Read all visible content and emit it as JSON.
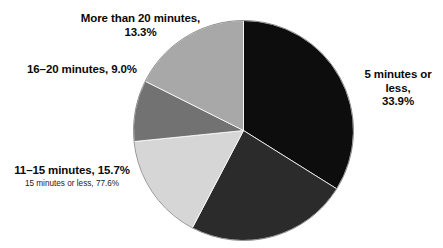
{
  "chart_data": {
    "type": "pie",
    "title": "",
    "subtitle": "",
    "xlabel": "",
    "ylabel": "",
    "legend_position": "none",
    "grid": false,
    "start_angle_deg": 0,
    "direction": "clockwise",
    "categories": [
      "5 minutes or less",
      "6–10 minutes",
      "11–15 minutes",
      "16–20 minutes",
      "More than 20 minutes"
    ],
    "values": [
      33.9,
      23.8,
      15.7,
      9.0,
      13.3
    ],
    "units": "%",
    "colors": [
      "#0d0d0d",
      "#2b2b2b",
      "#d6d6d6",
      "#727272",
      "#a8a8a8"
    ],
    "slices": [
      {
        "name": "5 minutes or less",
        "value": 33.9,
        "value_text": "33.9%",
        "color": "#0d0d0d",
        "start_deg": 0,
        "end_deg": 122.04,
        "labeled": true
      },
      {
        "name": "6–10 minutes",
        "value": 23.8,
        "value_text": "23.8%",
        "color": "#2b2b2b",
        "start_deg": 122.04,
        "end_deg": 207.72,
        "labeled": false
      },
      {
        "name": "11–15 minutes",
        "value": 15.7,
        "value_text": "15.7%",
        "color": "#d6d6d6",
        "start_deg": 207.72,
        "end_deg": 264.24,
        "labeled": true
      },
      {
        "name": "16–20 minutes",
        "value": 9.0,
        "value_text": "9.0%",
        "color": "#727272",
        "start_deg": 264.24,
        "end_deg": 296.64,
        "labeled": true
      },
      {
        "name": "More than 20 minutes",
        "value": 13.3,
        "value_text": "13.3%",
        "color": "#a8a8a8",
        "start_deg": 296.64,
        "end_deg": 360,
        "labeled": true
      }
    ],
    "annotations": [
      {
        "name": "cumulative-15-minutes-or-less",
        "text": "15 minutes or less, 77.6%",
        "value": 77.6
      }
    ]
  },
  "labels": {
    "more_than_20": "More than 20 minutes,\n13.3%",
    "sixteen_to_twenty": "16–20 minutes, 9.0%",
    "eleven_to_fifteen": "11–15 minutes, 15.7%",
    "fifteen_or_less_note": "15 minutes or less, 77.6%",
    "five_or_less": "5 minutes or less,\n33.9%"
  }
}
